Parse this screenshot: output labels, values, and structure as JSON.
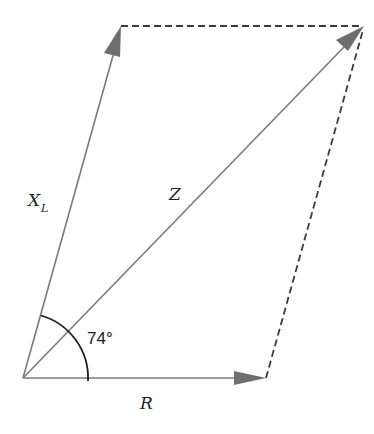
{
  "diagram": {
    "type": "impedance phasor diagram",
    "labels": {
      "inductive_reactance": "X",
      "inductive_reactance_subscript": "L",
      "impedance": "Z",
      "resistance": "R",
      "angle": "74°"
    },
    "vectors": [
      {
        "name": "R",
        "from": [
          23,
          378
        ],
        "to": [
          266,
          378
        ]
      },
      {
        "name": "X_L",
        "from": [
          23,
          378
        ],
        "to": [
          121,
          26
        ]
      },
      {
        "name": "Z",
        "from": [
          23,
          378
        ],
        "to": [
          364,
          26
        ]
      }
    ],
    "dashed_lines": [
      {
        "from": [
          121,
          26
        ],
        "to": [
          364,
          26
        ]
      },
      {
        "from": [
          266,
          378
        ],
        "to": [
          364,
          26
        ]
      }
    ],
    "angle_arc": {
      "center": [
        23,
        378
      ],
      "radius": 65,
      "degrees": 74
    },
    "colors": {
      "vector": "#7a7a7a",
      "arrowhead": "#6e6e6e",
      "dashed": "#3a3a3a",
      "arc": "#1e1e1e",
      "text": "#222222",
      "background": "#ffffff"
    }
  }
}
